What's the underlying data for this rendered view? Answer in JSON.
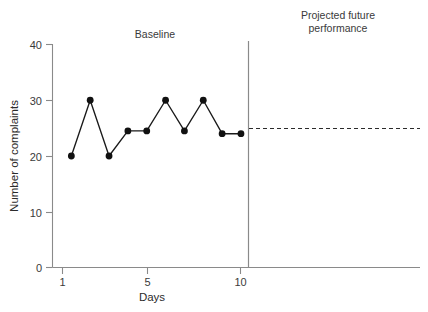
{
  "chart_data": {
    "type": "line",
    "title": "",
    "xlabel": "Days",
    "ylabel": "Number of complaints",
    "x": [
      1,
      2,
      3,
      4,
      5,
      6,
      7,
      8,
      9,
      10
    ],
    "values": [
      20,
      30,
      20,
      24.5,
      24.5,
      30,
      24.5,
      30,
      24,
      24
    ],
    "series": [
      {
        "name": "Baseline complaints",
        "values": [
          20,
          30,
          20,
          24.5,
          24.5,
          30,
          24.5,
          30,
          24,
          24
        ]
      }
    ],
    "xlim": [
      0,
      19.5
    ],
    "ylim": [
      0,
      40
    ],
    "x_ticks": [
      1,
      5,
      10
    ],
    "x_tick_labels": [
      "1",
      "5",
      "10"
    ],
    "y_ticks": [
      0,
      10,
      20,
      30,
      40
    ],
    "y_tick_labels": [
      "0",
      "10",
      "20",
      "30",
      "40"
    ],
    "grid": false,
    "legend": "none",
    "annotations": [
      {
        "name": "baseline-phase-label",
        "text": "Baseline",
        "x": 5.5,
        "y": 38.5
      },
      {
        "name": "projected-phase-label",
        "text": "Projected future performance",
        "x": 15,
        "y": 39
      }
    ],
    "phase_divider": {
      "name": "phase-divider",
      "x": 10.4,
      "description": "vertical line separating baseline from projected future performance"
    },
    "projection": {
      "name": "projection-line",
      "style": "dashed",
      "y": 24,
      "x_start": 10.4,
      "x_end": 19.4
    },
    "colors": {
      "line": "#1a1a1a",
      "point": "#111111",
      "axis": "#8a8a8a",
      "text": "#2b2b2b",
      "background": "#ffffff"
    }
  },
  "labels": {
    "y_axis_title": "Number of complaints",
    "x_axis_title": "Days",
    "baseline": "Baseline",
    "projected_line1": "Projected future",
    "projected_line2": "performance",
    "y_tick_40": "40",
    "y_tick_30": "30",
    "y_tick_20": "20",
    "y_tick_10": "10",
    "y_tick_0": "0",
    "x_tick_1": "1",
    "x_tick_5": "5",
    "x_tick_10": "10"
  }
}
